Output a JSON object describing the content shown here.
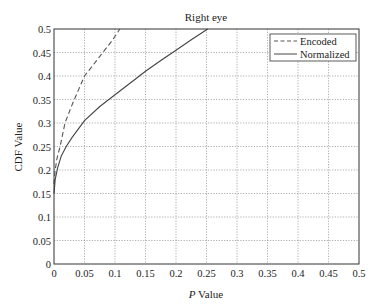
{
  "chart_data": {
    "type": "line",
    "title": "Right eye",
    "xlabel_italic": "P",
    "xlabel_rest": " Value",
    "xlabel": "P Value",
    "ylabel": "CDF Value",
    "xlim": [
      0,
      0.5
    ],
    "ylim": [
      0,
      0.5
    ],
    "grid": true,
    "legend_position": "upper right",
    "x_ticks": [
      "0",
      "0.05",
      "0.1",
      "0.15",
      "0.2",
      "0.25",
      "0.3",
      "0.35",
      "0.4",
      "0.45",
      "0.5"
    ],
    "y_ticks": [
      "0",
      "0.05",
      "0.1",
      "0.15",
      "0.2",
      "0.25",
      "0.3",
      "0.35",
      "0.4",
      "0.45",
      "0.5"
    ],
    "series": [
      {
        "name": "Encoded",
        "style": "dashed",
        "color": "#555555",
        "x": [
          0.0,
          0.002,
          0.005,
          0.01,
          0.018,
          0.03,
          0.04,
          0.05,
          0.065,
          0.08,
          0.095,
          0.108
        ],
        "y": [
          0.17,
          0.2,
          0.225,
          0.25,
          0.3,
          0.34,
          0.37,
          0.4,
          0.425,
          0.45,
          0.475,
          0.5
        ]
      },
      {
        "name": "Normalized",
        "style": "solid",
        "color": "#444444",
        "x": [
          0.0,
          0.002,
          0.006,
          0.012,
          0.02,
          0.03,
          0.05,
          0.075,
          0.1,
          0.125,
          0.15,
          0.175,
          0.2,
          0.225,
          0.252
        ],
        "y": [
          0.15,
          0.18,
          0.205,
          0.23,
          0.25,
          0.27,
          0.305,
          0.335,
          0.36,
          0.385,
          0.41,
          0.433,
          0.455,
          0.477,
          0.5
        ]
      }
    ]
  }
}
